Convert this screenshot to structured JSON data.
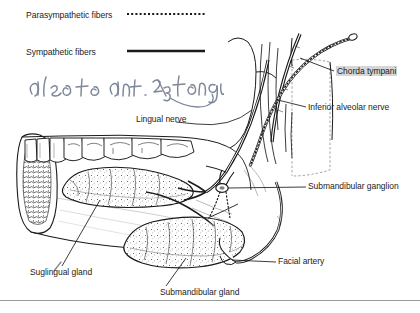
{
  "figure": {
    "width": 420,
    "height": 313
  },
  "legend": {
    "items": [
      {
        "label": "Parasympathetic fibers",
        "line_style": "dotted",
        "color": "#1a1a1a"
      },
      {
        "label": "Sympathetic fibers",
        "line_style": "solid",
        "color": "#1a1a1a"
      }
    ]
  },
  "annotations": {
    "handwritten": [
      {
        "name": "also-to-ant-2-3-tongue",
        "text": "also to ant. 2/3 tongue",
        "ink_color": "#7d8799",
        "has_pointer_tail": true
      },
      {
        "name": "sublingual-correction-mark",
        "text": "/",
        "ink_color": "#7d8799"
      }
    ]
  },
  "labels": [
    {
      "name": "chorda-tympani",
      "text": "Chorda tympani",
      "highlighted": true,
      "leader": true
    },
    {
      "name": "inferior-alveolar-nerve",
      "text": "Inferior alveolar nerve",
      "highlighted": false,
      "leader": true
    },
    {
      "name": "lingual-nerve",
      "text": "Lingual nerve",
      "highlighted": false,
      "leader": true
    },
    {
      "name": "submandibular-ganglion",
      "text": "Submandibular ganglion",
      "highlighted": false,
      "leader": true
    },
    {
      "name": "facial-artery",
      "text": "Facial artery",
      "highlighted": false,
      "leader": true
    },
    {
      "name": "sublingual-gland",
      "text": "Suglingual gland",
      "highlighted": false,
      "leader": true
    },
    {
      "name": "submandibular-gland",
      "text": "Submandibular gland",
      "highlighted": false,
      "leader": true
    }
  ],
  "colors": {
    "ink": "#1a1a1a",
    "paper": "#ffffff",
    "highlight": "#d6d6d6",
    "handwriting": "#7d8799",
    "rule": "#9a9a9a"
  }
}
